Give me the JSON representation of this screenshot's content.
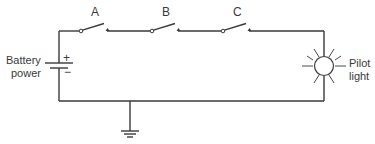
{
  "diagram": {
    "type": "electrical-schematic",
    "colors": {
      "line": "#3a3a3a",
      "text": "#3a3a3a",
      "background": "#ffffff"
    },
    "battery": {
      "label_line1": "Battery",
      "label_line2": "power",
      "positive": "+",
      "negative": "−"
    },
    "switches": [
      {
        "label": "A",
        "state": "open"
      },
      {
        "label": "B",
        "state": "open"
      },
      {
        "label": "C",
        "state": "open"
      }
    ],
    "lamp": {
      "label_line1": "Pilot",
      "label_line2": "light"
    },
    "ground": {
      "symbol": "ground"
    }
  }
}
